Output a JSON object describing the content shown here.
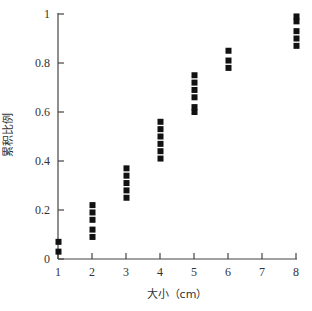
{
  "chart_data": {
    "type": "scatter",
    "title": "",
    "xlabel": "大小（cm）",
    "ylabel": "累积比例",
    "xlim": [
      1,
      8
    ],
    "ylim": [
      0,
      1
    ],
    "x_ticks": [
      "1",
      "2",
      "3",
      "4",
      "5",
      "6",
      "7",
      "8"
    ],
    "y_ticks": [
      "0",
      "0.2",
      "0.4",
      "0.6",
      "0.8",
      "1"
    ],
    "grid": false,
    "legend": null,
    "marker": "square",
    "marker_color": "#111111",
    "series": [
      {
        "name": "累积比例",
        "points": [
          {
            "x": 1,
            "y": 0.03
          },
          {
            "x": 1,
            "y": 0.07
          },
          {
            "x": 2,
            "y": 0.09
          },
          {
            "x": 2,
            "y": 0.12
          },
          {
            "x": 2,
            "y": 0.16
          },
          {
            "x": 2,
            "y": 0.19
          },
          {
            "x": 2,
            "y": 0.22
          },
          {
            "x": 3,
            "y": 0.25
          },
          {
            "x": 3,
            "y": 0.28
          },
          {
            "x": 3,
            "y": 0.31
          },
          {
            "x": 3,
            "y": 0.34
          },
          {
            "x": 3,
            "y": 0.37
          },
          {
            "x": 4,
            "y": 0.41
          },
          {
            "x": 4,
            "y": 0.44
          },
          {
            "x": 4,
            "y": 0.47
          },
          {
            "x": 4,
            "y": 0.5
          },
          {
            "x": 4,
            "y": 0.53
          },
          {
            "x": 4,
            "y": 0.56
          },
          {
            "x": 5,
            "y": 0.6
          },
          {
            "x": 5,
            "y": 0.62
          },
          {
            "x": 5,
            "y": 0.66
          },
          {
            "x": 5,
            "y": 0.69
          },
          {
            "x": 5,
            "y": 0.72
          },
          {
            "x": 5,
            "y": 0.75
          },
          {
            "x": 6,
            "y": 0.78
          },
          {
            "x": 6,
            "y": 0.81
          },
          {
            "x": 6,
            "y": 0.85
          },
          {
            "x": 8,
            "y": 0.87
          },
          {
            "x": 8,
            "y": 0.9
          },
          {
            "x": 8,
            "y": 0.93
          },
          {
            "x": 8,
            "y": 0.97
          },
          {
            "x": 8,
            "y": 0.99
          }
        ]
      }
    ]
  }
}
